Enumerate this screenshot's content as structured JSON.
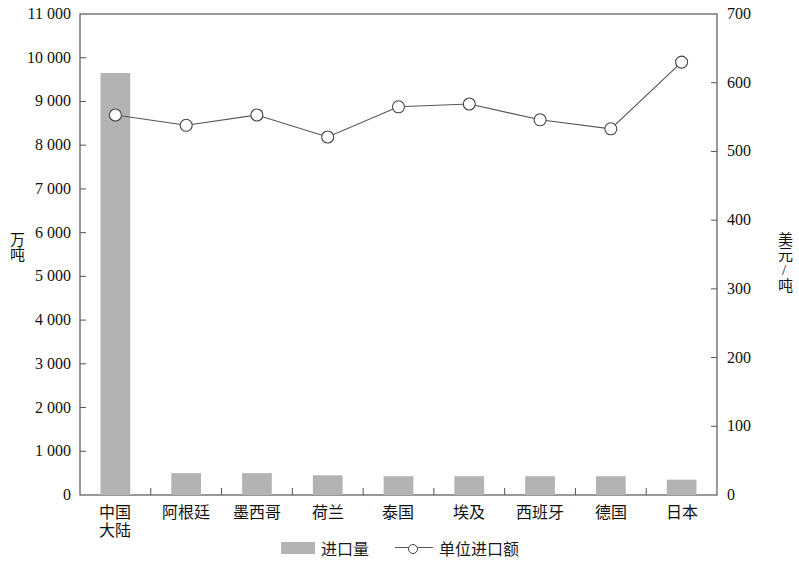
{
  "chart_data": {
    "type": "bar",
    "title": "",
    "subtitle": "",
    "categories": [
      "中国\n大陆",
      "阿根廷",
      "墨西哥",
      "荷兰",
      "泰国",
      "埃及",
      "西班牙",
      "德国",
      "日本"
    ],
    "category_labels": [
      {
        "line1": "中国",
        "line2": "大陆"
      },
      {
        "line1": "阿根廷",
        "line2": ""
      },
      {
        "line1": "墨西哥",
        "line2": ""
      },
      {
        "line1": "荷兰",
        "line2": ""
      },
      {
        "line1": "泰国",
        "line2": ""
      },
      {
        "line1": "埃及",
        "line2": ""
      },
      {
        "line1": "西班牙",
        "line2": ""
      },
      {
        "line1": "德国",
        "line2": ""
      },
      {
        "line1": "日本",
        "line2": ""
      }
    ],
    "series": [
      {
        "name": "进口量",
        "type": "bar",
        "axis": "left",
        "unit": "万吨",
        "color": "#b3b3b3",
        "values": [
          9650,
          500,
          500,
          450,
          430,
          430,
          430,
          430,
          350
        ]
      },
      {
        "name": "单位进口额",
        "type": "line",
        "axis": "right",
        "unit": "美元/吨",
        "color": "#555555",
        "marker": "open-circle",
        "values": [
          553,
          538,
          553,
          521,
          565,
          569,
          546,
          533,
          630
        ]
      }
    ],
    "xlabel": "",
    "ylabel": "万吨",
    "y2label": "美元/吨",
    "ylim": [
      0,
      11000
    ],
    "y2lim": [
      0,
      700
    ],
    "ytick_step": 1000,
    "y2tick_step": 100,
    "yticks": [
      "0",
      "1 000",
      "2 000",
      "3 000",
      "4 000",
      "5 000",
      "6 000",
      "7 000",
      "8 000",
      "9 000",
      "10 000",
      "11 000"
    ],
    "y2ticks": [
      "0",
      "100",
      "200",
      "300",
      "400",
      "500",
      "600",
      "700"
    ],
    "grid": false,
    "legend_position": "bottom-center",
    "legend": [
      {
        "label": "进口量",
        "marker": "bar-swatch"
      },
      {
        "label": "单位进口额",
        "marker": "line-circle"
      }
    ]
  },
  "plot": {
    "frame_color": "#555555",
    "bar_fill": "#b3b3b3",
    "line_color": "#555555",
    "marker_face": "#ffffff",
    "marker_edge": "#444444"
  }
}
